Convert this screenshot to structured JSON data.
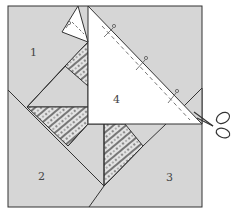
{
  "diagram": {
    "type": "quilt-block-paper-piecing",
    "labels": [
      {
        "id": "1",
        "text": "1",
        "x": 33,
        "y": 53
      },
      {
        "id": "2",
        "text": "2",
        "x": 41,
        "y": 180
      },
      {
        "id": "3",
        "text": "3",
        "x": 169,
        "y": 181
      },
      {
        "id": "4",
        "text": "4",
        "x": 116,
        "y": 103
      }
    ],
    "icons": [
      "scissors-icon",
      "pin-icon"
    ],
    "colors": {
      "gray_fabric": "#d3d3d3",
      "white_fabric": "#ffffff",
      "outline": "#333333",
      "print_fabric": "#c8c8c8"
    }
  }
}
